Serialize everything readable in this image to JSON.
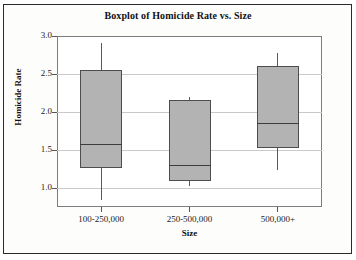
{
  "chart_data": {
    "type": "box",
    "title": "Boxplot of Homicide Rate vs. Size",
    "xlabel": "Size",
    "ylabel": "Homicide Rate",
    "categories": [
      "100-250,000",
      "250-500,000",
      "500,000+"
    ],
    "ylim": [
      0.7,
      3.0
    ],
    "yticks": [
      "1.0",
      "1.5",
      "2.0",
      "2.5",
      "3.0"
    ],
    "ytick_values": [
      1.0,
      1.5,
      2.0,
      2.5,
      3.0
    ],
    "grid": true,
    "legend": "none",
    "boxes": [
      {
        "category": "100-250,000",
        "whisker_low": 0.84,
        "q1": 1.26,
        "median": 1.58,
        "q3": 2.55,
        "whisker_high": 2.91
      },
      {
        "category": "250-500,000",
        "whisker_low": 1.03,
        "q1": 1.09,
        "median": 1.3,
        "q3": 2.16,
        "whisker_high": 2.2
      },
      {
        "category": "500,000+",
        "whisker_low": 1.24,
        "q1": 1.53,
        "median": 1.86,
        "q3": 2.61,
        "whisker_high": 2.78
      }
    ],
    "colors": {
      "box_fill": "#b3b3b3",
      "box_edge": "#4d4d4d",
      "median": "#3d3d3d",
      "whisker": "#5a5a5a",
      "grid": "#c9c9c9",
      "frame": "#7d7d7d",
      "text": "#111111",
      "background": "#ffffff"
    }
  }
}
